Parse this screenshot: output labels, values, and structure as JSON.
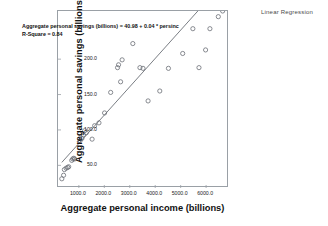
{
  "caption": "Linear Regression",
  "annotation": {
    "equation": "Aggregate personal savings (billions) = 40.98 + 0.04 * persinc",
    "r_square": "R-Square = 0.84"
  },
  "chart_data": {
    "type": "scatter",
    "title": "Linear Regression",
    "xlabel": "Aggregate personal income (billions)",
    "ylabel": "Aggregate personal savings (billions)",
    "xlim": [
      180,
      6900
    ],
    "ylim": [
      18,
      268
    ],
    "xticks": [
      "1000.0",
      "2000.0",
      "3000.0",
      "4000.0",
      "5000.0",
      "6000.0"
    ],
    "xtick_values": [
      1000,
      2000,
      3000,
      4000,
      5000,
      6000
    ],
    "yticks": [
      "50.0",
      "100.0",
      "150.0",
      "200.0"
    ],
    "ytick_values": [
      50,
      100,
      150,
      200
    ],
    "grid": false,
    "legend": "none",
    "marker": "open-circle",
    "marker_color": "#6b6f76",
    "fit_line": {
      "type": "linear",
      "intercept": 40.98,
      "slope": 0.04,
      "r_square": 0.84,
      "color": "#6b6f76",
      "x_start": 330,
      "x_end": 6750
    },
    "points": [
      {
        "x": 330,
        "y": 31
      },
      {
        "x": 400,
        "y": 36
      },
      {
        "x": 430,
        "y": 44
      },
      {
        "x": 500,
        "y": 46
      },
      {
        "x": 560,
        "y": 47
      },
      {
        "x": 600,
        "y": 48
      },
      {
        "x": 720,
        "y": 57
      },
      {
        "x": 760,
        "y": 59
      },
      {
        "x": 800,
        "y": 60
      },
      {
        "x": 830,
        "y": 59
      },
      {
        "x": 1050,
        "y": 85
      },
      {
        "x": 1120,
        "y": 88
      },
      {
        "x": 1180,
        "y": 93
      },
      {
        "x": 1230,
        "y": 99
      },
      {
        "x": 1290,
        "y": 96
      },
      {
        "x": 1520,
        "y": 87
      },
      {
        "x": 1620,
        "y": 106
      },
      {
        "x": 1790,
        "y": 110
      },
      {
        "x": 2010,
        "y": 124
      },
      {
        "x": 2250,
        "y": 153
      },
      {
        "x": 2520,
        "y": 188
      },
      {
        "x": 2560,
        "y": 192
      },
      {
        "x": 2700,
        "y": 199
      },
      {
        "x": 2640,
        "y": 168
      },
      {
        "x": 3120,
        "y": 222
      },
      {
        "x": 3400,
        "y": 188
      },
      {
        "x": 3520,
        "y": 187
      },
      {
        "x": 3720,
        "y": 141
      },
      {
        "x": 4180,
        "y": 155
      },
      {
        "x": 4520,
        "y": 187
      },
      {
        "x": 5080,
        "y": 208
      },
      {
        "x": 5480,
        "y": 243
      },
      {
        "x": 5720,
        "y": 188
      },
      {
        "x": 5980,
        "y": 213
      },
      {
        "x": 6150,
        "y": 243
      },
      {
        "x": 6480,
        "y": 260
      },
      {
        "x": 6650,
        "y": 268
      }
    ]
  }
}
